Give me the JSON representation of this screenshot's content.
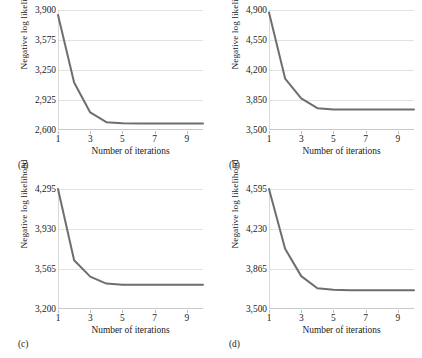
{
  "figure": {
    "background": "#ffffff",
    "curve_color": "#6e6e6e",
    "grid_color": "#e2e2e2"
  },
  "common": {
    "xlabel": "Number of iterations",
    "ylabel": "Negative log likelihood",
    "xticks": [
      "1",
      "3",
      "5",
      "7",
      "9"
    ]
  },
  "chart_data": [
    {
      "type": "line",
      "panel": "a",
      "caption": "(a)",
      "title": "",
      "xlabel": "Number of iterations",
      "ylabel": "Negative log likelihood",
      "xticklabels": [
        "1",
        "3",
        "5",
        "7",
        "9"
      ],
      "yticklabels": [
        "3,900",
        "3,575",
        "3,250",
        "2,925",
        "2,600"
      ],
      "xlim": [
        1,
        10
      ],
      "ylim": [
        2600,
        3900
      ],
      "grid": true,
      "legend": "none",
      "x": [
        1,
        2,
        3,
        4,
        5,
        6,
        7,
        8,
        9,
        10
      ],
      "values": [
        3845,
        3115,
        2790,
        2685,
        2672,
        2670,
        2670,
        2670,
        2670,
        2670
      ],
      "series": [
        {
          "name": "Negative log likelihood",
          "values": [
            3845,
            3115,
            2790,
            2685,
            2672,
            2670,
            2670,
            2670,
            2670,
            2670
          ]
        }
      ]
    },
    {
      "type": "line",
      "panel": "b",
      "caption": "(b)",
      "title": "",
      "xlabel": "Number of iterations",
      "ylabel": "Negative log likelihood",
      "xticklabels": [
        "1",
        "3",
        "5",
        "7",
        "9"
      ],
      "yticklabels": [
        "4,900",
        "4,550",
        "4,200",
        "3,850",
        "3,500"
      ],
      "xlim": [
        1,
        10
      ],
      "ylim": [
        3500,
        4900
      ],
      "grid": true,
      "legend": "none",
      "x": [
        1,
        2,
        3,
        4,
        5,
        6,
        7,
        8,
        9,
        10
      ],
      "values": [
        4870,
        4100,
        3870,
        3755,
        3740,
        3740,
        3740,
        3740,
        3740,
        3740
      ],
      "series": [
        {
          "name": "Negative log likelihood",
          "values": [
            4870,
            4100,
            3870,
            3755,
            3740,
            3740,
            3740,
            3740,
            3740,
            3740
          ]
        }
      ]
    },
    {
      "type": "line",
      "panel": "c",
      "caption": "(c)",
      "title": "",
      "xlabel": "Number of iterations",
      "ylabel": "Negative log likelihood",
      "xticklabels": [
        "1",
        "3",
        "5",
        "7",
        "9"
      ],
      "yticklabels": [
        "4,295",
        "3,930",
        "3,565",
        "3,200"
      ],
      "xlim": [
        1,
        10
      ],
      "ylim": [
        3200,
        4295
      ],
      "grid": true,
      "legend": "none",
      "x": [
        1,
        2,
        3,
        4,
        5,
        6,
        7,
        8,
        9,
        10
      ],
      "values": [
        4295,
        3645,
        3495,
        3432,
        3422,
        3422,
        3422,
        3422,
        3422,
        3422
      ],
      "series": [
        {
          "name": "Negative log likelihood",
          "values": [
            4295,
            3645,
            3495,
            3432,
            3422,
            3422,
            3422,
            3422,
            3422,
            3422
          ]
        }
      ]
    },
    {
      "type": "line",
      "panel": "d",
      "caption": "(d)",
      "title": "",
      "xlabel": "Number of iterations",
      "ylabel": "Negative log likelihood",
      "xticklabels": [
        "1",
        "3",
        "5",
        "7",
        "9"
      ],
      "yticklabels": [
        "4,595",
        "4,230",
        "3,865",
        "3,500"
      ],
      "xlim": [
        1,
        10
      ],
      "ylim": [
        3500,
        4595
      ],
      "grid": true,
      "legend": "none",
      "x": [
        1,
        2,
        3,
        4,
        5,
        6,
        7,
        8,
        9,
        10
      ],
      "values": [
        4595,
        4050,
        3800,
        3690,
        3675,
        3672,
        3672,
        3672,
        3672,
        3672
      ],
      "series": [
        {
          "name": "Negative log likelihood",
          "values": [
            4595,
            4050,
            3800,
            3690,
            3675,
            3672,
            3672,
            3672,
            3672,
            3672
          ]
        }
      ]
    }
  ]
}
